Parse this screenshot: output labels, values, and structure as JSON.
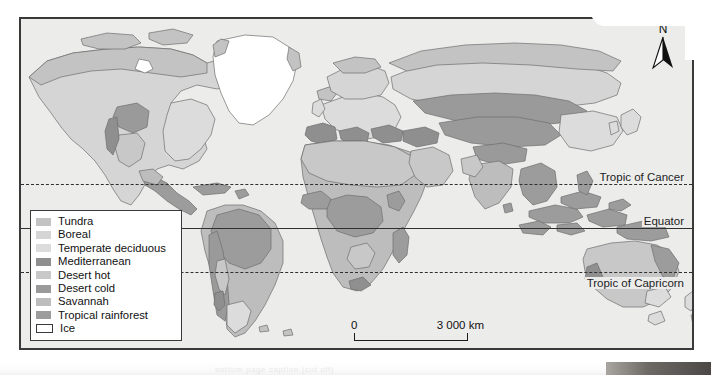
{
  "map": {
    "title": "World biomes map",
    "north_arrow": {
      "label": "N",
      "icon": "north-arrow-icon"
    },
    "latitude_lines": [
      {
        "id": "tropic-of-cancer",
        "label": "Tropic of Cancer",
        "style": "dashed",
        "y_pct": 50.2
      },
      {
        "id": "equator",
        "label": "Equator",
        "style": "solid",
        "y_pct": 63.5
      },
      {
        "id": "tropic-of-capricorn",
        "label": "Tropic of Capricorn",
        "style": "dashed",
        "y_pct": 76.9
      }
    ],
    "scale_bar": {
      "min_label": "0",
      "max_label": "3 000 km"
    },
    "legend": {
      "items": [
        {
          "label": "Tundra",
          "color": "#c3c3c3"
        },
        {
          "label": "Boreal",
          "color": "#d5d5d5"
        },
        {
          "label": "Temperate deciduous",
          "color": "#dcdcdc"
        },
        {
          "label": "Mediterranean",
          "color": "#8f8f8f"
        },
        {
          "label": "Desert hot",
          "color": "#c8c8c8"
        },
        {
          "label": "Desert cold",
          "color": "#9a9a9a"
        },
        {
          "label": "Savannah",
          "color": "#bdbdbd"
        },
        {
          "label": "Tropical rainforest",
          "color": "#9c9c9c"
        },
        {
          "label": "Ice",
          "color": "#ffffff"
        }
      ]
    },
    "colors": {
      "ocean": "#ececeb",
      "frame": "#3a3a3a",
      "line": "#2f2f2f",
      "ice": "#ffffff"
    },
    "caption_ghost": "bottom page caption (cut off)"
  }
}
